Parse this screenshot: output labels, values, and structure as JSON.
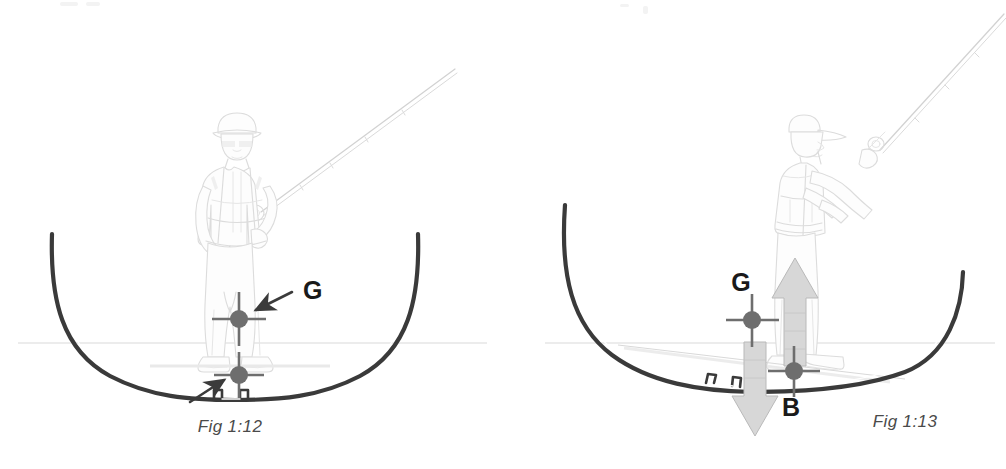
{
  "page": {
    "background_color": "#ffffff",
    "width": 1006,
    "height": 469
  },
  "figures": [
    {
      "id": "fig-1-12",
      "caption": "Fig 1:12",
      "caption_x": 230,
      "caption_y": 432,
      "description": "Upright boat hull in cross-section with an angler standing centred; centre of gravity G marked above centre of buoyancy.",
      "labels": [
        {
          "name": "centre-of-gravity",
          "text": "G",
          "x": 303,
          "y": 299
        }
      ],
      "markers": [
        {
          "name": "centre-of-gravity-marker",
          "x": 239,
          "y": 319,
          "radius": 9
        },
        {
          "name": "centre-of-buoyancy-marker",
          "x": 239,
          "y": 375,
          "radius": 9
        }
      ],
      "annotation_arrows": [
        {
          "name": "g-pointer-arrow",
          "from_x": 292,
          "from_y": 292,
          "to_x": 250,
          "to_y": 313
        },
        {
          "name": "buoyancy-pointer-arrow",
          "from_x": 196,
          "from_y": 398,
          "to_x": 228,
          "to_y": 377
        }
      ],
      "hull": {
        "name": "hull-cross-section-upright",
        "heel_degrees": 0
      },
      "waterline": {
        "name": "waterline",
        "y": 343
      }
    },
    {
      "id": "fig-1-13",
      "caption": "Fig 1:13",
      "caption_x": 855,
      "caption_y": 427,
      "description": "Heeled boat hull with the angler standing to one side; weight acts down at G and buoyancy acts up at B, creating a capsizing couple.",
      "labels": [
        {
          "name": "centre-of-gravity",
          "text": "G",
          "x": 741,
          "y": 291
        },
        {
          "name": "centre-of-buoyancy",
          "text": "B",
          "x": 791,
          "y": 416
        }
      ],
      "markers": [
        {
          "name": "centre-of-gravity-marker",
          "x": 752,
          "y": 320,
          "radius": 9
        },
        {
          "name": "centre-of-buoyancy-marker",
          "x": 794,
          "y": 371,
          "radius": 9
        }
      ],
      "force_arrows": [
        {
          "name": "buoyancy-up-arrow",
          "direction": "up",
          "x": 795,
          "top_y": 262,
          "bottom_y": 361
        },
        {
          "name": "gravity-down-arrow",
          "direction": "down",
          "x": 755,
          "top_y": 345,
          "bottom_y": 434
        }
      ],
      "hull": {
        "name": "hull-cross-section-heeled",
        "heel_degrees": 11
      },
      "waterline": {
        "name": "waterline",
        "y": 343
      }
    }
  ],
  "colors": {
    "hull_stroke": "#3a3a3a",
    "figure_outline": "#dcdcdc",
    "marker_grey": "#6e6e6e",
    "force_arrow_fill": "#d7d7d7",
    "label_text": "#1a1a1a",
    "caption_text": "#4a4a4a",
    "waterline": "#d9d9d9"
  }
}
